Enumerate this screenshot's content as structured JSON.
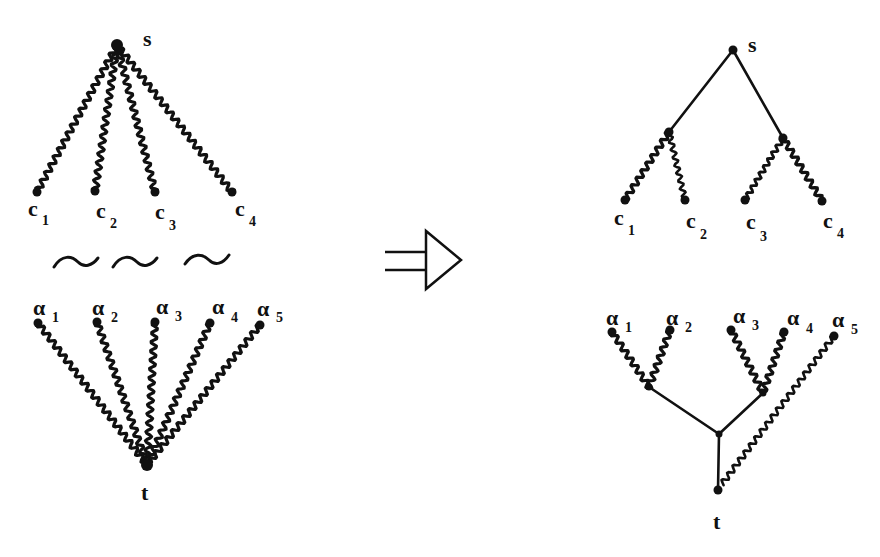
{
  "diagram": {
    "arrow_symbol": "implies-arrow",
    "left": {
      "source_label": "s",
      "sink_label": "t",
      "c_labels": [
        {
          "base": "c",
          "sub": "1"
        },
        {
          "base": "c",
          "sub": "2"
        },
        {
          "base": "c",
          "sub": "3"
        },
        {
          "base": "c",
          "sub": "4"
        }
      ],
      "alpha_labels": [
        {
          "base": "α",
          "sub": "1"
        },
        {
          "base": "α",
          "sub": "2"
        },
        {
          "base": "α",
          "sub": "3"
        },
        {
          "base": "α",
          "sub": "4"
        },
        {
          "base": "α",
          "sub": "5"
        }
      ],
      "equivalence_symbols": [
        "~",
        "~",
        "~"
      ]
    },
    "right": {
      "source_label": "s",
      "sink_label": "t",
      "c_labels": [
        {
          "base": "c",
          "sub": "1"
        },
        {
          "base": "c",
          "sub": "2"
        },
        {
          "base": "c",
          "sub": "3"
        },
        {
          "base": "c",
          "sub": "4"
        }
      ],
      "alpha_labels": [
        {
          "base": "α",
          "sub": "1"
        },
        {
          "base": "α",
          "sub": "2"
        },
        {
          "base": "α",
          "sub": "3"
        },
        {
          "base": "α",
          "sub": "4"
        },
        {
          "base": "α",
          "sub": "5"
        }
      ]
    },
    "colors": {
      "ink": "#111111",
      "background": "#ffffff"
    }
  }
}
